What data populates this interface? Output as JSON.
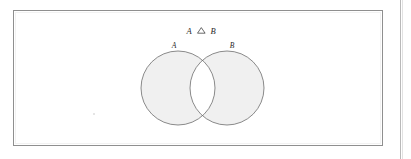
{
  "figure": {
    "caption_expression": "A △ B",
    "operator_name": "symmetric-difference",
    "frame": {
      "x": 13,
      "y": 10,
      "width": 370,
      "height": 136,
      "border_color": "#8f8f8f"
    },
    "labels": {
      "set_a": "A",
      "set_b": "B"
    },
    "colors": {
      "page_background": "#ffffff",
      "shade_fill": "#f0f0f0",
      "circle_stroke": "#6d6d6d",
      "text": "#2a2a2a",
      "frame": "#8f8f8f",
      "scan_rule": "#b9b9b9"
    },
    "geometry": {
      "circle_a": {
        "cx": 178,
        "cy": 88,
        "r": 37
      },
      "circle_b": {
        "cx": 227,
        "cy": 88,
        "r": 37
      },
      "expression_position": {
        "x": 202,
        "y": 31
      },
      "label_a_position": {
        "x": 174,
        "y": 47
      },
      "label_b_position": {
        "x": 232,
        "y": 47
      }
    },
    "shaded_regions": [
      "A-only",
      "B-only"
    ],
    "unshaded_regions": [
      "A-intersect-B",
      "outside-both"
    ]
  }
}
